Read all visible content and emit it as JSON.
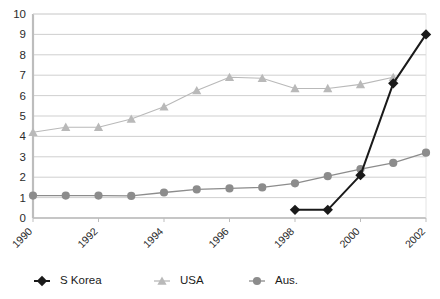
{
  "chart_data": {
    "type": "line",
    "title": "",
    "subtitle": "",
    "xlabel": "",
    "ylabel": "",
    "x": [
      1990,
      1991,
      1992,
      1993,
      1994,
      1995,
      1996,
      1997,
      1998,
      1999,
      2000,
      2001,
      2002
    ],
    "xtick_labels": [
      "1990",
      "1992",
      "1994",
      "1996",
      "1998",
      "2000",
      "2002"
    ],
    "xtick_values": [
      1990,
      1992,
      1994,
      1996,
      1998,
      2000,
      2002
    ],
    "ytick_labels": [
      "0",
      "1",
      "2",
      "3",
      "4",
      "5",
      "6",
      "7",
      "8",
      "9",
      "10"
    ],
    "ylim": [
      0,
      10
    ],
    "xlim": [
      1990,
      2002
    ],
    "grid": "horizontal",
    "legend_position": "bottom",
    "series": [
      {
        "name": "S Korea",
        "marker": "diamond",
        "color": "#1a1a1a",
        "x": [
          1998,
          1999,
          2000,
          2001,
          2002
        ],
        "values": [
          0.4,
          0.4,
          2.1,
          6.6,
          9.0
        ]
      },
      {
        "name": "USA",
        "marker": "triangle",
        "color": "#b9b9b9",
        "x": [
          1990,
          1991,
          1992,
          1993,
          1994,
          1995,
          1996,
          1997,
          1998,
          1999,
          2000,
          2001
        ],
        "values": [
          4.2,
          4.45,
          4.45,
          4.85,
          5.45,
          6.25,
          6.9,
          6.85,
          6.35,
          6.35,
          6.55,
          6.9
        ]
      },
      {
        "name": "Aus.",
        "marker": "circle",
        "color": "#8c8c8c",
        "x": [
          1990,
          1991,
          1992,
          1993,
          1994,
          1995,
          1996,
          1997,
          1998,
          1999,
          2000,
          2001,
          2002
        ],
        "values": [
          1.1,
          1.1,
          1.1,
          1.08,
          1.25,
          1.4,
          1.45,
          1.5,
          1.7,
          2.05,
          2.4,
          2.7,
          3.2
        ]
      }
    ]
  },
  "legend": {
    "items": [
      {
        "label": "S Korea",
        "color": "#1a1a1a",
        "marker": "diamond"
      },
      {
        "label": "USA",
        "color": "#b9b9b9",
        "marker": "triangle"
      },
      {
        "label": "Aus.",
        "color": "#8c8c8c",
        "marker": "circle"
      }
    ]
  },
  "colors": {
    "s_korea": "#1a1a1a",
    "usa": "#b9b9b9",
    "aus": "#8c8c8c",
    "gridline": "#c9c9c9",
    "axis": "#bdbdbd",
    "background": "#ffffff",
    "text": "#2b2b2b"
  }
}
